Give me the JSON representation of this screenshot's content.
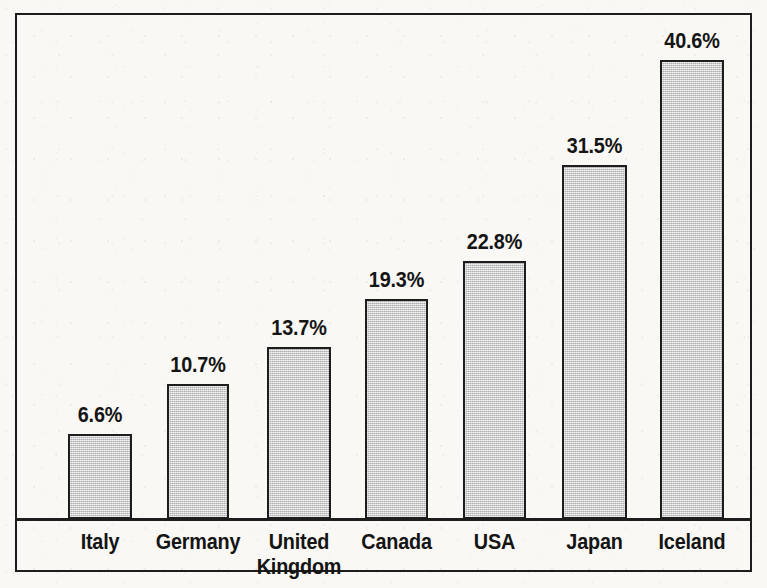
{
  "chart_data": {
    "type": "bar",
    "title": "",
    "subtitle": "",
    "xlabel": "",
    "ylabel": "",
    "grid": false,
    "legend": "none",
    "axis": {
      "y_visible": false,
      "x_visible": true,
      "ylim": [
        0,
        47.5
      ],
      "value_suffix": "%"
    },
    "categories": [
      "Italy",
      "Germany",
      "United\nKingdom",
      "Canada",
      "USA",
      "Japan",
      "Iceland"
    ],
    "values": [
      6.6,
      10.7,
      13.7,
      19.3,
      22.8,
      31.5,
      40.6
    ],
    "value_labels": [
      "6.6%",
      "10.7%",
      "13.7%",
      "19.3%",
      "22.8%",
      "31.5%",
      "40.6%"
    ],
    "bars": [
      {
        "category": "Italy",
        "label_line1": "Italy",
        "label_line2": "",
        "value": 6.6,
        "value_label": "6.6%",
        "x": 68,
        "width": 64,
        "top": 434
      },
      {
        "category": "Germany",
        "label_line1": "Germany",
        "label_line2": "",
        "value": 10.7,
        "value_label": "10.7%",
        "x": 167,
        "width": 62,
        "top": 384
      },
      {
        "category": "United Kingdom",
        "label_line1": "United",
        "label_line2": "Kingdom",
        "value": 13.7,
        "value_label": "13.7%",
        "x": 267,
        "width": 64,
        "top": 347
      },
      {
        "category": "Canada",
        "label_line1": "Canada",
        "label_line2": "",
        "value": 19.3,
        "value_label": "19.3%",
        "x": 365,
        "width": 63,
        "top": 299
      },
      {
        "category": "USA",
        "label_line1": "USA",
        "label_line2": "",
        "value": 22.8,
        "value_label": "22.8%",
        "x": 463,
        "width": 63,
        "top": 261
      },
      {
        "category": "Japan",
        "label_line1": "Japan",
        "label_line2": "",
        "value": 31.5,
        "value_label": "31.5%",
        "x": 562,
        "width": 65,
        "top": 165
      },
      {
        "category": "Iceland",
        "label_line1": "Iceland",
        "label_line2": "",
        "value": 40.6,
        "value_label": "40.6%",
        "x": 660,
        "width": 64,
        "top": 60
      }
    ],
    "colors": {
      "bar_fill": "#c9c9c9",
      "bar_stroke": "#1d1d1d",
      "text": "#141414",
      "frame": "#1d1d1d",
      "background": "#f9f8f5"
    }
  }
}
